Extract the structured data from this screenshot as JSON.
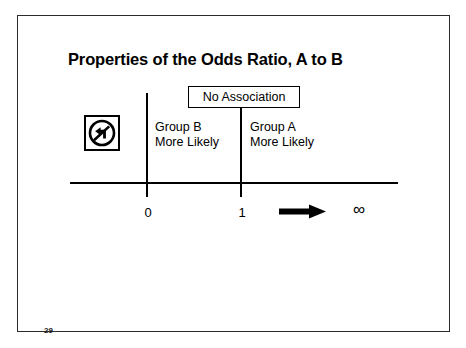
{
  "slide": {
    "title": "Properties of the Odds Ratio, A to B",
    "page_number": "29"
  },
  "diagram": {
    "type": "number-line",
    "callout": {
      "label": "No Association",
      "at_value": "1"
    },
    "no_turn_sign": {
      "icon": "no-left-turn-icon",
      "meaning": "no left turn"
    },
    "regions": [
      {
        "id": "left",
        "line1": "Group B",
        "line2": "More Likely",
        "range": "0 to 1"
      },
      {
        "id": "right",
        "line1": "Group A",
        "line2": "More Likely",
        "range": "1 to infinity"
      }
    ],
    "ticks": [
      {
        "label": "0",
        "value": 0
      },
      {
        "label": "1",
        "value": 1
      }
    ],
    "endpoint": {
      "label": "∞",
      "name": "infinity"
    },
    "arrow": {
      "direction": "right",
      "name": "increasing-direction-arrow"
    },
    "colors": {
      "ink": "#000000",
      "frame": "#2b2b2b",
      "background": "#ffffff"
    }
  }
}
